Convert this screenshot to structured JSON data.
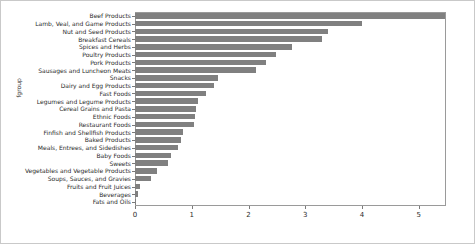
{
  "chart_data": {
    "type": "bar",
    "orientation": "horizontal",
    "title": "",
    "xlabel": "",
    "ylabel": "fgroup",
    "xlim": [
      0,
      5.48
    ],
    "xticks": [
      0,
      1,
      2,
      3,
      4,
      5
    ],
    "xticklabels": [
      "0",
      "1",
      "2",
      "3",
      "4",
      "5"
    ],
    "grid": false,
    "legend": null,
    "bar_color": "#808080",
    "categories": [
      "Beef Products",
      "Lamb, Veal, and Game Products",
      "Nut and Seed Products",
      "Breakfast Cereals",
      "Spices and Herbs",
      "Poultry Products",
      "Pork Products",
      "Sausages and Luncheon Meats",
      "Snacks",
      "Dairy and Egg Products",
      "Fast Foods",
      "Legumes and Legume Products",
      "Cereal Grains and Pasta",
      "Ethnic Foods",
      "Restaurant Foods",
      "Finfish and Shellfish Products",
      "Baked Products",
      "Meals, Entrees, and Sidedishes",
      "Baby Foods",
      "Sweets",
      "Vegetables and Vegetable Products",
      "Soups, Sauces, and Gravies",
      "Fruits and Fruit Juices",
      "Beverages",
      "Fats and Oils"
    ],
    "values": [
      5.47,
      4.0,
      3.4,
      3.3,
      2.77,
      2.49,
      2.31,
      2.13,
      1.46,
      1.39,
      1.25,
      1.11,
      1.08,
      1.06,
      1.04,
      0.85,
      0.81,
      0.76,
      0.64,
      0.58,
      0.39,
      0.28,
      0.09,
      0.05,
      0.01
    ]
  }
}
